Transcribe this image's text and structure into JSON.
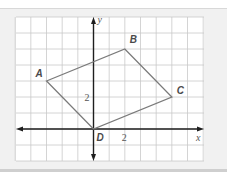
{
  "diagram": {
    "type": "coordinate-plane-quadrilateral",
    "axes": {
      "x_label": "x",
      "y_label": "y",
      "x_range": [
        -5,
        7
      ],
      "y_range": [
        -2,
        7
      ],
      "x_tick_label": "2",
      "y_tick_label": "2"
    },
    "points": [
      {
        "name": "A",
        "x": -3,
        "y": 3
      },
      {
        "name": "B",
        "x": 2,
        "y": 5
      },
      {
        "name": "C",
        "x": 5,
        "y": 2
      },
      {
        "name": "D",
        "x": 0,
        "y": 0
      }
    ],
    "polygon_order": [
      "A",
      "B",
      "C",
      "D"
    ],
    "colors": {
      "panel_background": "#f1f1f1",
      "grid_background": "#ffffff",
      "grid_line": "#c9c9c9",
      "axis": "#1e1e1e",
      "shape_stroke": "#7a7a7a"
    }
  }
}
